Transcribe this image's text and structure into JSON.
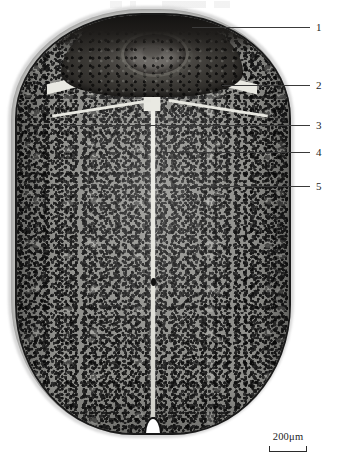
{
  "figure": {
    "background_color": "#ffffff",
    "modality": "light-microscopy-grayscale"
  },
  "specimen": {
    "name": "ovoid-specimen-section",
    "description": "Ovoid transverse section with dark apical cap, pale suture band and granular body tissue divided by a pale midline",
    "outline_color": "#1a1a1a",
    "tissue_color": "#8f8f8b",
    "cap_color": "#2e2c29",
    "suture_color": "#e9e9e2"
  },
  "callouts": [
    {
      "number": "1",
      "line_y": 27,
      "line_start_x": 192,
      "line_end_x": 310,
      "num_x": 316,
      "num_y": 22
    },
    {
      "number": "2",
      "line_y": 85,
      "line_start_x": 222,
      "line_end_x": 310,
      "num_x": 316,
      "num_y": 80
    },
    {
      "number": "3",
      "line_y": 125,
      "line_start_x": 64,
      "line_end_x": 310,
      "num_x": 316,
      "num_y": 120
    },
    {
      "number": "4",
      "line_y": 152,
      "line_start_x": 163,
      "line_end_x": 310,
      "num_x": 316,
      "num_y": 147
    },
    {
      "number": "5",
      "line_y": 186,
      "line_start_x": 196,
      "line_end_x": 310,
      "num_x": 316,
      "num_y": 181
    }
  ],
  "scale_bar": {
    "label": "200μm",
    "value": 200,
    "unit": "μm",
    "bar_width_px": 36,
    "color": "#2b2b2b"
  }
}
